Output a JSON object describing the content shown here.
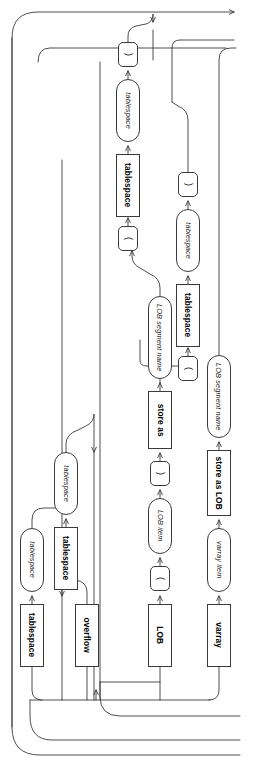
{
  "diagram": {
    "kind": "railroad-syntax-diagram",
    "title": "",
    "orientation": "rotated-90-clockwise",
    "colors": {
      "stroke": "#3a3a3a",
      "text": "#000000",
      "background": "#ffffff"
    },
    "branches": [
      {
        "name": "tablespace-clause",
        "sequence": [
          "tablespace",
          "tablespace"
        ]
      },
      {
        "name": "overflow-clause",
        "sequence": [
          "overflow",
          "tablespace",
          "tablespace"
        ]
      },
      {
        "name": "lob-clause",
        "sequence": [
          "LOB",
          "(",
          "LOB item",
          ")",
          "store as",
          "LOB segment name",
          "(",
          "tablespace",
          "tablespace",
          ")"
        ]
      },
      {
        "name": "varray-clause",
        "sequence": [
          "varray",
          "varray item",
          "store as LOB",
          "LOB segment name"
        ]
      }
    ],
    "nodes": [
      {
        "id": "n1",
        "label": "tablespace",
        "shape": "keyword",
        "x": 20,
        "y": 604,
        "w": 24,
        "h": 63
      },
      {
        "id": "n2",
        "label": "tablespace",
        "shape": "nonterminal",
        "x": 20,
        "y": 528,
        "w": 24,
        "h": 64
      },
      {
        "id": "n3",
        "label": "overflow",
        "shape": "keyword",
        "x": 75,
        "y": 604,
        "w": 24,
        "h": 63
      },
      {
        "id": "n4",
        "label": "tablespace",
        "shape": "keyword",
        "x": 54,
        "y": 527,
        "w": 24,
        "h": 63
      },
      {
        "id": "n5",
        "label": "tablespace",
        "shape": "nonterminal",
        "x": 54,
        "y": 452,
        "w": 24,
        "h": 63
      },
      {
        "id": "n6",
        "label": "LOB",
        "shape": "keyword",
        "x": 148,
        "y": 604,
        "w": 24,
        "h": 63
      },
      {
        "id": "n7",
        "label": "(",
        "shape": "paren",
        "x": 150,
        "y": 566,
        "w": 20,
        "h": 25
      },
      {
        "id": "n8",
        "label": "LOB item",
        "shape": "nonterminal",
        "x": 148,
        "y": 498,
        "w": 24,
        "h": 56
      },
      {
        "id": "n9",
        "label": ")",
        "shape": "paren",
        "x": 150,
        "y": 461,
        "w": 20,
        "h": 25
      },
      {
        "id": "n10",
        "label": "store as",
        "shape": "keyword",
        "x": 148,
        "y": 391,
        "w": 24,
        "h": 58
      },
      {
        "id": "n11",
        "label": "LOB segment name",
        "shape": "nonterminal",
        "x": 148,
        "y": 296,
        "w": 24,
        "h": 83
      },
      {
        "id": "n12",
        "label": "(",
        "shape": "paren",
        "x": 178,
        "y": 356,
        "w": 20,
        "h": 25
      },
      {
        "id": "n13",
        "label": "tablespace",
        "shape": "keyword",
        "x": 176,
        "y": 284,
        "w": 24,
        "h": 63
      },
      {
        "id": "n14",
        "label": "tablespace",
        "shape": "nonterminal",
        "x": 176,
        "y": 209,
        "w": 24,
        "h": 63
      },
      {
        "id": "n15",
        "label": ")",
        "shape": "paren",
        "x": 178,
        "y": 172,
        "w": 20,
        "h": 25
      },
      {
        "id": "n16",
        "label": "varray",
        "shape": "keyword",
        "x": 207,
        "y": 604,
        "w": 24,
        "h": 63
      },
      {
        "id": "n17",
        "label": "varray item",
        "shape": "nonterminal",
        "x": 207,
        "y": 528,
        "w": 24,
        "h": 64
      },
      {
        "id": "n18",
        "label": "store as LOB",
        "shape": "keyword",
        "x": 207,
        "y": 450,
        "w": 24,
        "h": 66
      },
      {
        "id": "n19",
        "label": "LOB segment name",
        "shape": "nonterminal",
        "x": 207,
        "y": 355,
        "w": 24,
        "h": 83
      },
      {
        "id": "n20",
        "label": "(",
        "shape": "paren",
        "x": 118,
        "y": 226,
        "w": 20,
        "h": 25
      },
      {
        "id": "n21",
        "label": "tablespace",
        "shape": "keyword",
        "x": 116,
        "y": 154,
        "w": 24,
        "h": 63
      },
      {
        "id": "n22",
        "label": "tablespace",
        "shape": "nonterminal",
        "x": 116,
        "y": 79,
        "w": 24,
        "h": 63
      },
      {
        "id": "n23",
        "label": ")",
        "shape": "paren",
        "x": 118,
        "y": 42,
        "w": 20,
        "h": 25
      }
    ]
  }
}
